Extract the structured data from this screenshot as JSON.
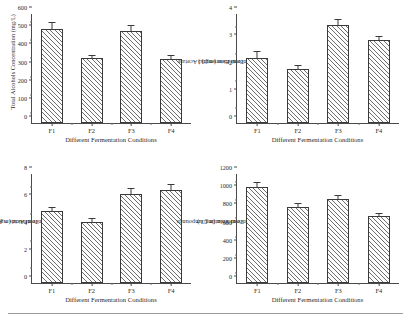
{
  "figure": {
    "panel_count": 4,
    "shared_xlabel": "Different Fermentation Conditions",
    "categories": [
      "F1",
      "F2",
      "F3",
      "F4"
    ]
  },
  "chart_data": [
    {
      "id": "total-alcohols",
      "type": "bar",
      "title": "",
      "xlabel": "Different Fermentation Conditions",
      "ylabel": "Total Alcohols Concentration (mg/L)",
      "categories": [
        "F1",
        "F2",
        "F3",
        "F4"
      ],
      "values": [
        520,
        360,
        505,
        352
      ],
      "errors": [
        18,
        8,
        16,
        10
      ],
      "ylim": [
        0,
        600
      ],
      "yticks": [
        0,
        100,
        200,
        300,
        400,
        500,
        600
      ],
      "ytick_labels": [
        "0",
        "100",
        "200",
        "300",
        "400",
        "500",
        "600"
      ],
      "grid": false,
      "legend": "none"
    },
    {
      "id": "total-esters-ethyl-acetate",
      "type": "bar",
      "title": "",
      "xlabel": "Different Fermentation Conditions",
      "ylabel": "Total Esters-ethyl Acetate Concentration (mg/L)",
      "ylabel_line1": "Total Esters-ethyl Acetate",
      "ylabel_line2": "Concentration (mg/L)",
      "categories": [
        "F1",
        "F2",
        "F3",
        "F4"
      ],
      "values": [
        2.4,
        2.0,
        3.6,
        3.05
      ],
      "errors": [
        0.12,
        0.07,
        0.1,
        0.08
      ],
      "ylim": [
        0,
        4
      ],
      "yticks": [
        0,
        1,
        2,
        3,
        4
      ],
      "ytick_labels": [
        "0",
        "1",
        "2",
        "3",
        "4"
      ],
      "grid": false,
      "legend": "none"
    },
    {
      "id": "total-acids-acetic-acid",
      "type": "bar",
      "title": "",
      "xlabel": "Different Fermentation Conditions",
      "ylabel": "Total Acids – Acetic Acid Concentration (mg/L)",
      "ylabel_line1": "Total Acids – Acetic Acid",
      "ylabel_line2": "Concentration (mg/L)",
      "categories": [
        "F1",
        "F2",
        "F3",
        "F4"
      ],
      "values": [
        5.25,
        4.5,
        6.55,
        6.85
      ],
      "errors": [
        0.18,
        0.12,
        0.2,
        0.22
      ],
      "ylim": [
        0,
        8
      ],
      "yticks": [
        0,
        2,
        4,
        6,
        8
      ],
      "ytick_labels": [
        "0",
        "2",
        "4",
        "6",
        "8"
      ],
      "grid": false,
      "legend": "none"
    },
    {
      "id": "total-volatile-compounds",
      "type": "bar",
      "title": "",
      "xlabel": "Different Fermentation Conditions",
      "ylabel": "Total Volatile Compounds Concentration (mg/L)",
      "ylabel_line1": "Total Volatile Compounds",
      "ylabel_line2": "Concentration (mg/L)",
      "categories": [
        "F1",
        "F2",
        "F3",
        "F4"
      ],
      "values": [
        1060,
        840,
        925,
        740
      ],
      "errors": [
        28,
        18,
        20,
        16
      ],
      "ylim": [
        0,
        1200
      ],
      "yticks": [
        0,
        200,
        400,
        600,
        800,
        1000,
        1200
      ],
      "ytick_labels": [
        "0",
        "200",
        "400",
        "600",
        "800",
        "1000",
        "1200"
      ],
      "grid": false,
      "legend": "none"
    }
  ],
  "colors": {
    "axis": "#4a4a4a",
    "bar_edge": "#3a3a3a",
    "bar_hatch": "#6e6e6e",
    "bar_fill": "#fdfdfd",
    "text": "#2b2b2b",
    "rule": "#9a9a9a"
  }
}
